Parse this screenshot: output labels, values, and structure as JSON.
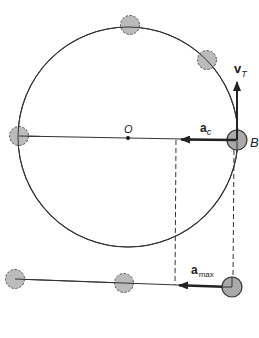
{
  "figure": {
    "colors": {
      "line": "#333333",
      "ball_fill": "#b9b9b9",
      "ball_fill_active": "#a8a8a8",
      "ball_dashed_stroke": "#555555",
      "ball_solid_stroke": "#333333",
      "background": "#ffffff"
    }
  },
  "labels": {
    "center": "O",
    "point_b": "B",
    "velocity_main": "v",
    "velocity_sub": "T",
    "centripetal_main": "a",
    "centripetal_sub": "c",
    "max_accel_main": "a",
    "max_accel_sub": "max"
  },
  "circle": {
    "cx": 128,
    "cy": 137,
    "r": 110
  },
  "balls_on_circle": [
    {
      "name": "left",
      "cx": 19,
      "cy": 136,
      "style": "dashed"
    },
    {
      "name": "top",
      "cx": 130,
      "cy": 25,
      "style": "dashed"
    },
    {
      "name": "upper-right",
      "cx": 207,
      "cy": 60,
      "style": "dashed"
    },
    {
      "name": "B",
      "cx": 237,
      "cy": 140,
      "style": "solid"
    }
  ],
  "balls_on_line": [
    {
      "name": "left",
      "cx": 15,
      "cy": 279,
      "style": "dashed"
    },
    {
      "name": "middle",
      "cx": 124,
      "cy": 283,
      "style": "dashed"
    },
    {
      "name": "right",
      "cx": 232,
      "cy": 287,
      "style": "solid"
    }
  ],
  "vectors": {
    "v_T": {
      "from": [
        237,
        140
      ],
      "to": [
        237,
        80
      ]
    },
    "a_c": {
      "from": [
        237,
        140
      ],
      "to": [
        180,
        140
      ]
    },
    "a_max": {
      "from": [
        232,
        287
      ],
      "to": [
        176,
        285
      ]
    }
  },
  "projection_lines": [
    {
      "x1": 176,
      "y1": 140,
      "x2": 175,
      "y2": 285
    },
    {
      "x1": 234,
      "y1": 150,
      "x2": 233,
      "y2": 280
    }
  ]
}
